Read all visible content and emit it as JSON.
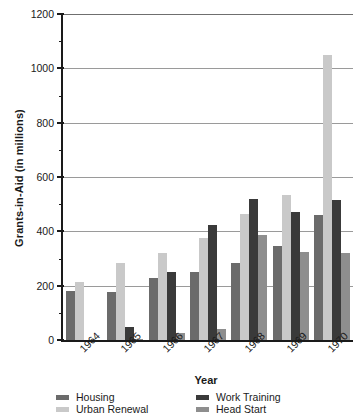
{
  "chart_data": {
    "type": "bar",
    "title": "",
    "xlabel": "Year",
    "ylabel": "Grants-in-Aid (in millions)",
    "categories": [
      "1964",
      "1965",
      "1966",
      "1967",
      "1968",
      "1969",
      "1970"
    ],
    "ylim": [
      0,
      1200
    ],
    "yticks": [
      0,
      200,
      400,
      600,
      800,
      1000,
      1200
    ],
    "ytick_labels": [
      "0",
      "200",
      "400",
      "600",
      "800",
      "1000",
      "1200"
    ],
    "grid": true,
    "grid_axis": "y",
    "legend_position": "bottom",
    "series": [
      {
        "name": "Housing",
        "color": "#6b6b6b",
        "values": [
          180,
          178,
          230,
          250,
          285,
          345,
          460
        ]
      },
      {
        "name": "Urban Renewal",
        "color": "#c9c9c9",
        "values": [
          212,
          283,
          320,
          375,
          465,
          535,
          1050
        ]
      },
      {
        "name": "Work Training",
        "color": "#3a3a3a",
        "values": [
          0,
          48,
          250,
          425,
          520,
          470,
          515
        ]
      },
      {
        "name": "Head Start",
        "color": "#8e8e8e",
        "values": [
          0,
          5,
          25,
          40,
          385,
          325,
          320
        ]
      }
    ]
  },
  "axes": {
    "y_title": "Grants-in-Aid (in millions)",
    "x_title": "Year"
  },
  "legend": {
    "entries": [
      {
        "label": "Housing",
        "color": "#6b6b6b",
        "swatch": "legend-swatch-housing"
      },
      {
        "label": "Work Training",
        "color": "#3a3a3a",
        "swatch": "legend-swatch-work-training"
      },
      {
        "label": "Urban Renewal",
        "color": "#c9c9c9",
        "swatch": "legend-swatch-urban-renewal"
      },
      {
        "label": "Head Start",
        "color": "#8e8e8e",
        "swatch": "legend-swatch-head-start"
      }
    ]
  }
}
